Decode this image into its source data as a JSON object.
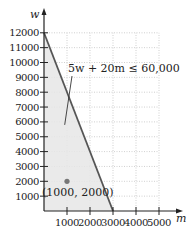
{
  "chart_data": {
    "type": "line",
    "title": "",
    "xlabel": "m",
    "ylabel": "w",
    "xlim": [
      0,
      5000
    ],
    "ylim": [
      0,
      12000
    ],
    "grid": true,
    "x_ticks": [
      1000,
      2000,
      3000,
      4000,
      5000
    ],
    "y_ticks": [
      1000,
      2000,
      3000,
      4000,
      5000,
      6000,
      7000,
      8000,
      9000,
      10000,
      11000,
      12000
    ],
    "x_tick_labels": [
      "1000",
      "2000",
      "3000",
      "4000",
      "5000"
    ],
    "y_tick_labels": [
      "1000",
      "2000",
      "3000",
      "4000",
      "5000",
      "6000",
      "7000",
      "8000",
      "9000",
      "10000",
      "11000",
      "12000"
    ],
    "series": [
      {
        "name": "5w + 20m = 60,000",
        "type": "line",
        "x": [
          0,
          3000
        ],
        "y": [
          12000,
          0
        ]
      }
    ],
    "shaded_region": {
      "description": "Feasible region 5w + 20m ≤ 60,000, m ≥ 0, w ≥ 0",
      "vertices": [
        [
          0,
          0
        ],
        [
          0,
          12000
        ],
        [
          3000,
          0
        ]
      ],
      "color": "#e6e6e6"
    },
    "points": [
      {
        "x": 1000,
        "y": 2000,
        "label": "(1000, 2000)"
      }
    ],
    "annotations": [
      {
        "text": "5w + 20m ≤ 60,000",
        "points_to": [
          900,
          5800
        ]
      }
    ],
    "colors": {
      "line": "#555555",
      "region": "#e6e6e6",
      "point": "#777777",
      "grid": "#b0b0b0",
      "axis": "#222222"
    }
  },
  "labels": {
    "x_axis": "m",
    "y_axis": "w",
    "inequality": "5w + 20m ≤ 60,000",
    "point": "(1000, 2000)"
  }
}
